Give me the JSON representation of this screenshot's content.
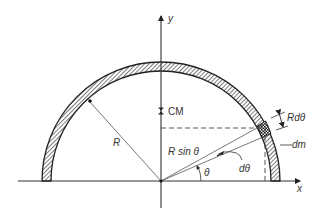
{
  "diagram": {
    "colors": {
      "stroke": "#222222",
      "thin": "#555555",
      "hatch": "#333333",
      "background": "#ffffff"
    },
    "geometry": {
      "origin": [
        161,
        181
      ],
      "outer_radius": 119,
      "inner_radius": 110,
      "element_angle_deg": 28,
      "dtheta_deg": 6
    },
    "labels": {
      "y_axis": "y",
      "x_axis": "x",
      "cm": "CM",
      "radius": "R",
      "r_sin_theta": "R sin θ",
      "d_theta": "dθ",
      "theta": "θ",
      "r_d_theta": "Rdθ",
      "dm": "dm"
    }
  }
}
